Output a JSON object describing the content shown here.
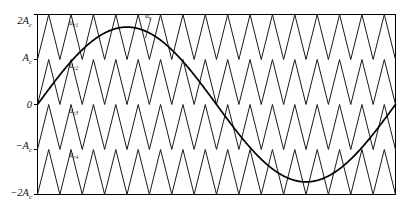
{
  "figure": {
    "title": "",
    "kind": "multilevel-pwm-carrier-diagram"
  },
  "axes": {
    "y_ticks": [
      {
        "label": "2A",
        "sub": "c",
        "value": 2
      },
      {
        "label": "A",
        "sub": "c",
        "value": 1
      },
      {
        "label": "0",
        "sub": "",
        "value": 0
      },
      {
        "label": "−A",
        "sub": "c",
        "value": -1
      },
      {
        "label": "−2A",
        "sub": "c",
        "value": -2
      }
    ],
    "ylim": [
      -2,
      2
    ],
    "xlim": [
      0,
      1
    ],
    "x_ticks_visible": false,
    "grid": false,
    "frame_color": "#000000"
  },
  "labels": {
    "carrier1": {
      "base": "u",
      "sub": "c1"
    },
    "carrier2": {
      "base": "u",
      "sub": "c2"
    },
    "carrier3": {
      "base": "u",
      "sub": "c3"
    },
    "carrier4": {
      "base": "u",
      "sub": "c4"
    },
    "reference": {
      "base": "u",
      "sub": "r"
    }
  },
  "chart_data": {
    "type": "line",
    "title": "",
    "xlabel": "",
    "ylabel": "",
    "xlim": [
      0,
      1
    ],
    "ylim": [
      -2,
      2
    ],
    "grid": false,
    "legend": "inline-annotations",
    "carrier": {
      "waveform": "triangular",
      "count": 4,
      "cycles": 16,
      "peak_to_peak": 1,
      "phase_disposition": "in-phase (PD-PWM)",
      "bands": [
        [
          1,
          2
        ],
        [
          0,
          1
        ],
        [
          -1,
          0
        ],
        [
          -2,
          -1
        ]
      ],
      "names": [
        "u_c1",
        "u_c2",
        "u_c3",
        "u_c4"
      ]
    },
    "reference": {
      "waveform": "sinusoidal",
      "name": "u_r",
      "amplitude": 1.72,
      "cycles": 1,
      "phase_deg": 0,
      "offset": 0
    },
    "series": [
      {
        "name": "u_c1",
        "type": "triangle",
        "band": [
          1,
          2
        ]
      },
      {
        "name": "u_c2",
        "type": "triangle",
        "band": [
          0,
          1
        ]
      },
      {
        "name": "u_c3",
        "type": "triangle",
        "band": [
          -1,
          0
        ]
      },
      {
        "name": "u_c4",
        "type": "triangle",
        "band": [
          -2,
          -1
        ]
      },
      {
        "name": "u_r",
        "type": "sine",
        "amplitude": 1.72
      }
    ]
  },
  "colors": {
    "carrier_stroke": "#1a1a1a",
    "reference_stroke": "#000000",
    "frame": "#000000",
    "background": "#ffffff"
  }
}
